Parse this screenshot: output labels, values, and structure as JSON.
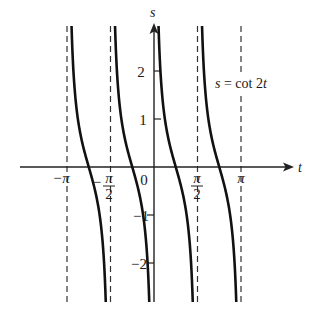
{
  "chart_data": {
    "type": "line",
    "title": "",
    "function": "s = cot 2t",
    "annotation": "s = cot 2t",
    "xlabel": "t",
    "ylabel": "s",
    "x_ticks": [
      {
        "value": -3.14159,
        "label": "−π"
      },
      {
        "value": -1.5708,
        "label": "−π/2"
      },
      {
        "value": 0,
        "label": "0"
      },
      {
        "value": 1.5708,
        "label": "π/2"
      },
      {
        "value": 3.14159,
        "label": "π"
      }
    ],
    "y_ticks": [
      {
        "value": 2,
        "label": "2"
      },
      {
        "value": 1,
        "label": "1"
      },
      {
        "value": -1,
        "label": "−1"
      },
      {
        "value": -2,
        "label": "−2"
      }
    ],
    "asymptotes": [
      -3.14159,
      -1.5708,
      0,
      1.5708,
      3.14159
    ],
    "branches": [
      {
        "from": -3.14159,
        "to": -1.5708
      },
      {
        "from": -1.5708,
        "to": 0
      },
      {
        "from": 0,
        "to": 1.5708
      },
      {
        "from": 1.5708,
        "to": 3.14159
      }
    ],
    "xlim": [
      -3.9,
      4.9
    ],
    "ylim": [
      -2.81,
      2.94
    ],
    "grid": false,
    "legend": "none",
    "line_color": "#111111",
    "asymptote_style": "dashed"
  },
  "labels": {
    "x_axis": "t",
    "y_axis": "s",
    "equation_lhs": "s",
    "equation_eq": " = cot 2",
    "equation_var": "t",
    "x_tick_neg_pi": "−π",
    "x_tick_neg_half_minus": "−",
    "x_tick_pi_sym": "π",
    "x_tick_two": "2",
    "x_tick_zero": "0",
    "x_tick_pi": "π",
    "y_tick_2": "2",
    "y_tick_1": "1",
    "y_tick_m1": "−1",
    "y_tick_m2": "−2"
  }
}
